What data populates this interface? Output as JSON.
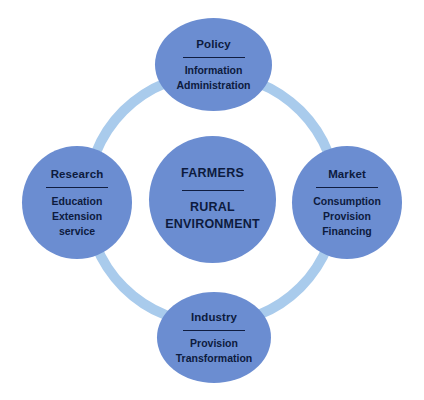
{
  "diagram": {
    "type": "cycle-hub-and-spoke",
    "colors": {
      "ring": "#a9cbec",
      "node_fill": "#6b8dd1",
      "text": "#0d1b3e",
      "background": "#ffffff"
    },
    "center": {
      "title": "FARMERS",
      "items": [
        "RURAL",
        "ENVIRONMENT"
      ]
    },
    "nodes": [
      {
        "id": "policy",
        "title": "Policy",
        "items": [
          "Information",
          "Administration"
        ]
      },
      {
        "id": "market",
        "title": "Market",
        "items": [
          "Consumption",
          "Provision",
          "Financing"
        ]
      },
      {
        "id": "industry",
        "title": "Industry",
        "items": [
          "Provision",
          "Transformation"
        ]
      },
      {
        "id": "research",
        "title": "Research",
        "items": [
          "Education",
          "Extension",
          "service"
        ]
      }
    ]
  }
}
